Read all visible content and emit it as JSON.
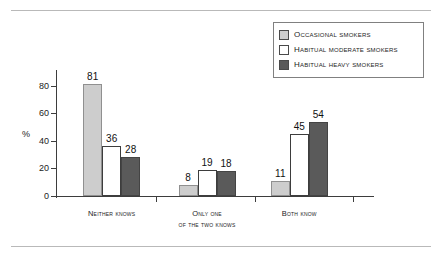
{
  "chart_data": {
    "type": "bar",
    "title": "",
    "xlabel": "",
    "ylabel": "%",
    "ylim": [
      0,
      90
    ],
    "yticks": [
      0,
      20,
      40,
      60,
      80
    ],
    "grid": false,
    "legend_position": "top-right",
    "categories": [
      "Neither knows",
      "Only one of the two knows",
      "Both know"
    ],
    "category_lines": [
      [
        "Neither knows",
        ""
      ],
      [
        "Only one",
        "of the two knows"
      ],
      [
        "Both know",
        ""
      ]
    ],
    "series": [
      {
        "name": "Occasional smokers",
        "values": [
          81,
          8,
          11
        ],
        "color": "#cdcdcd"
      },
      {
        "name": "Habitual moderate smokers",
        "values": [
          36,
          19,
          45
        ],
        "color": "#ffffff"
      },
      {
        "name": "Habitual heavy smokers",
        "values": [
          28,
          18,
          54
        ],
        "color": "#5a5a5a"
      }
    ]
  },
  "legend": {
    "items": [
      {
        "label": "Occasional smokers",
        "swatch": "#cdcdcd"
      },
      {
        "label": "Habitual moderate smokers",
        "swatch": "#ffffff"
      },
      {
        "label": "Habitual heavy smokers",
        "swatch": "#5a5a5a"
      }
    ]
  },
  "axis": {
    "y_label": "%",
    "y_ticks": [
      "0",
      "20",
      "40",
      "60",
      "80"
    ]
  }
}
